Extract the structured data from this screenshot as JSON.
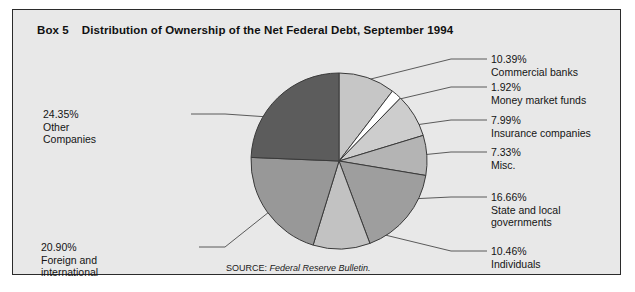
{
  "box": {
    "number": "Box 5",
    "title": "Distribution of Ownership of the Net Federal Debt, September 1994"
  },
  "source": {
    "label": "SOURCE:",
    "publication": "Federal Reserve Bulletin."
  },
  "colors": {
    "panel_background": "#e8e8e8",
    "panel_border": "#2b2b2b",
    "page_background": "#ffffff",
    "slice_outline": "#3a3a3a",
    "leader_line": "#4a4a4a",
    "text": "#141414"
  },
  "chart_data": {
    "type": "pie",
    "title": "Distribution of Ownership of the Net Federal Debt, September 1994",
    "units": "percent",
    "start_angle_deg": 0,
    "direction": "clockwise",
    "total": 100.0,
    "categories": [
      "Commercial banks",
      "Money market funds",
      "Insurance companies",
      "Misc.",
      "State and local governments",
      "Individuals",
      "Foreign and international",
      "Other Companies"
    ],
    "values": [
      10.39,
      1.92,
      7.99,
      7.33,
      16.66,
      10.46,
      20.9,
      24.35
    ],
    "slices": [
      {
        "label": "Commercial banks",
        "pct_text": "10.39%",
        "value": 10.39,
        "color": "#c6c6c6",
        "side": "right"
      },
      {
        "label": "Money market funds",
        "pct_text": "1.92%",
        "value": 1.92,
        "color": "#ffffff",
        "side": "right"
      },
      {
        "label": "Insurance companies",
        "pct_text": "7.99%",
        "value": 7.99,
        "color": "#cdcdcd",
        "side": "right"
      },
      {
        "label": "Misc.",
        "pct_text": "7.33%",
        "value": 7.33,
        "color": "#b4b4b4",
        "side": "right"
      },
      {
        "label": "State and local governments",
        "pct_text": "16.66%",
        "value": 16.66,
        "color": "#9e9e9e",
        "side": "right"
      },
      {
        "label": "Individuals",
        "pct_text": "10.46%",
        "value": 10.46,
        "color": "#c2c2c2",
        "side": "right"
      },
      {
        "label": "Foreign and international",
        "pct_text": "20.90%",
        "value": 20.9,
        "color": "#989898",
        "side": "left"
      },
      {
        "label": "Other Companies",
        "pct_text": "24.35%",
        "value": 24.35,
        "color": "#5c5c5c",
        "side": "left"
      }
    ],
    "legend_position": "callouts",
    "grid": false
  },
  "callouts": [
    {
      "name": "commercial-banks",
      "pct": "10.39%",
      "lines": [
        "Commercial banks"
      ],
      "x": 478,
      "y": 43,
      "side": "right"
    },
    {
      "name": "money-market",
      "pct": "1.92%",
      "lines": [
        "Money market funds"
      ],
      "x": 478,
      "y": 71,
      "side": "right"
    },
    {
      "name": "insurance",
      "pct": "7.99%",
      "lines": [
        "Insurance companies"
      ],
      "x": 478,
      "y": 104,
      "side": "right"
    },
    {
      "name": "misc",
      "pct": "7.33%",
      "lines": [
        "Misc."
      ],
      "x": 478,
      "y": 136,
      "side": "right"
    },
    {
      "name": "state-local",
      "pct": "16.66%",
      "lines": [
        "State and local",
        "governments"
      ],
      "x": 478,
      "y": 181,
      "side": "right"
    },
    {
      "name": "individuals",
      "pct": "10.46%",
      "lines": [
        "Individuals"
      ],
      "x": 478,
      "y": 235,
      "side": "right"
    },
    {
      "name": "other-companies",
      "pct": "24.35%",
      "lines": [
        "Other",
        "Companies"
      ],
      "x": 30,
      "y": 98,
      "side": "left"
    },
    {
      "name": "foreign-intl",
      "pct": "20.90%",
      "lines": [
        "Foreign and",
        "international"
      ],
      "x": 28,
      "y": 231,
      "side": "left"
    }
  ]
}
